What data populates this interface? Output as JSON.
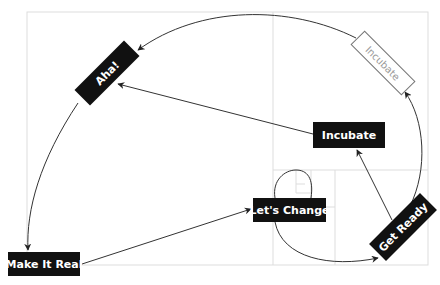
{
  "diagram": {
    "type": "golden-spiral-cycle",
    "colors": {
      "node_fill": "#111111",
      "node_text": "#ffffff",
      "ghost_border": "#777777",
      "ghost_text": "#999999",
      "grid": "#dddddd",
      "line": "#333333"
    },
    "nodes": [
      {
        "id": "lets-change",
        "label": "Let's Change"
      },
      {
        "id": "get-ready",
        "label": "Get Ready"
      },
      {
        "id": "incubate",
        "label": "Incubate"
      },
      {
        "id": "aha",
        "label": "Aha!"
      },
      {
        "id": "make-it-real",
        "label": "Make It Real"
      },
      {
        "id": "incubate-ghost",
        "label": "Incubate",
        "style": "ghost"
      }
    ],
    "edges": [
      {
        "from": "lets-change",
        "to": "get-ready",
        "kind": "spiral-curve"
      },
      {
        "from": "get-ready",
        "to": "incubate",
        "kind": "straight"
      },
      {
        "from": "get-ready",
        "to": "incubate-ghost",
        "kind": "spiral-curve"
      },
      {
        "from": "incubate",
        "to": "aha",
        "kind": "straight"
      },
      {
        "from": "incubate-ghost",
        "to": "aha",
        "kind": "spiral-curve"
      },
      {
        "from": "aha",
        "to": "make-it-real",
        "kind": "spiral-curve"
      },
      {
        "from": "make-it-real",
        "to": "lets-change",
        "kind": "straight"
      }
    ]
  }
}
